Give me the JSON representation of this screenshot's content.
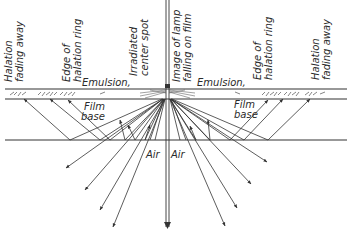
{
  "diagram": {
    "type": "optical cross-section",
    "labels": {
      "halation_fading_left_1": "Halation",
      "halation_fading_left_2": "fading away",
      "edge_ring_left_1": "Edge of",
      "edge_ring_left_2": "halation ring",
      "irradiated_1": "Irradiated",
      "irradiated_2": "center spot",
      "lamp_1": "Image of lamp",
      "lamp_2": "falling on film",
      "edge_ring_right_1": "Edge of",
      "edge_ring_right_2": "halation ring",
      "halation_fading_right_1": "Halation",
      "halation_fading_right_2": "fading away",
      "emulsion_left": "Emulsion,",
      "emulsion_right": "Emulsion,",
      "film_base_left_1": "Film",
      "film_base_left_2": "base",
      "film_base_right_1": "Film",
      "film_base_right_2": "base",
      "air_left": "Air",
      "air_right": "Air"
    },
    "layers": [
      "Emulsion",
      "Film base",
      "Air"
    ],
    "colors": {
      "ink": "#333333",
      "background": "#ffffff"
    }
  }
}
